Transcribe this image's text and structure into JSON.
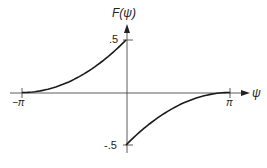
{
  "chart_data": {
    "type": "line",
    "title": "",
    "xlabel": "ψ",
    "ylabel": "F(ψ)",
    "xlim": [
      -3.1416,
      3.1416
    ],
    "ylim": [
      -0.5,
      0.5
    ],
    "grid": false,
    "legend": null,
    "x_tick_labels": [
      "−π",
      "π"
    ],
    "y_tick_labels": [
      ".5",
      "-.5"
    ],
    "series": [
      {
        "name": "F(ψ) for ψ<0",
        "x": [
          -3.1416,
          -2.3562,
          -1.5708,
          -0.7854,
          0.0
        ],
        "y": [
          0.0,
          0.031,
          0.125,
          0.281,
          0.5
        ]
      },
      {
        "name": "F(ψ) for ψ>0",
        "x": [
          0.0,
          0.7854,
          1.5708,
          2.3562,
          3.1416
        ],
        "y": [
          -0.5,
          -0.281,
          -0.125,
          -0.031,
          0.0
        ]
      }
    ]
  },
  "labels": {
    "y_axis": "F(ψ)",
    "x_axis": "ψ",
    "y_top": ".5",
    "y_bottom": "-.5",
    "x_left": "−π",
    "x_right": "π"
  },
  "colors": {
    "ink": "#222222",
    "background": "#ffffff"
  }
}
